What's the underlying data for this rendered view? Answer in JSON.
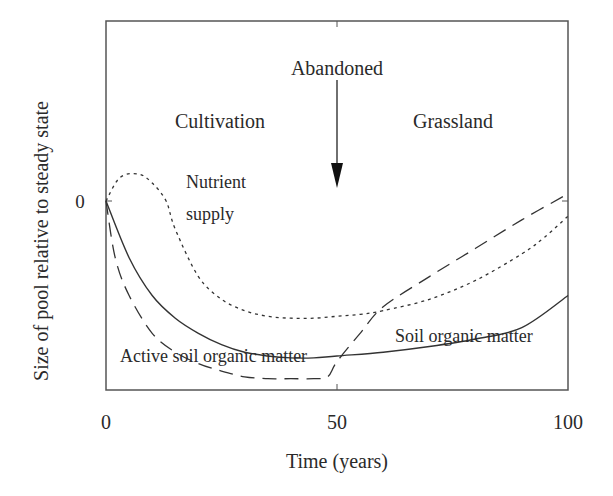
{
  "chart_data": {
    "type": "line",
    "title": "",
    "xlabel": "Time (years)",
    "ylabel": "Size of pool relative to steady state",
    "xlim": [
      0,
      100
    ],
    "ylim": [
      -1.0,
      0.95
    ],
    "x_ticks": [
      0,
      50,
      100
    ],
    "x_tick_labels": [
      "0",
      "50",
      "100"
    ],
    "y_ticks": [
      0
    ],
    "y_tick_labels": [
      "0"
    ],
    "grid": false,
    "legend": "none (curves labeled inline)",
    "annotations": [
      {
        "text": "Abandoned",
        "x": 50,
        "y": 0.8,
        "arrow": {
          "from_y": 0.64,
          "to_y": 0.07,
          "x": 50
        }
      },
      {
        "text": "Cultivation",
        "x": 25,
        "y": 0.48
      },
      {
        "text": "Grassland",
        "x": 75,
        "y": 0.48
      },
      {
        "text": "Nutrient",
        "x": 25,
        "y": 0.09
      },
      {
        "text": "supply",
        "x": 25,
        "y": -0.06
      },
      {
        "text": "Soil organic matter",
        "x": 81,
        "y": -0.75
      },
      {
        "text": "Active soil organic matter",
        "x": 28,
        "y": -0.86
      }
    ],
    "series": [
      {
        "name": "Nutrient supply",
        "style": "dotted",
        "x": [
          0,
          3,
          7,
          10,
          13,
          15,
          20,
          25,
          30,
          35,
          40,
          45,
          50,
          55,
          60,
          70,
          80,
          90,
          95,
          100
        ],
        "y": [
          0.0,
          0.13,
          0.15,
          0.1,
          0.0,
          -0.15,
          -0.4,
          -0.52,
          -0.58,
          -0.61,
          -0.62,
          -0.62,
          -0.61,
          -0.6,
          -0.58,
          -0.52,
          -0.42,
          -0.28,
          -0.19,
          -0.08
        ]
      },
      {
        "name": "Soil organic matter",
        "style": "solid",
        "x": [
          0,
          5,
          10,
          15,
          20,
          25,
          30,
          35,
          40,
          45,
          50,
          60,
          70,
          80,
          90,
          100
        ],
        "y": [
          0.0,
          -0.3,
          -0.5,
          -0.62,
          -0.7,
          -0.76,
          -0.8,
          -0.82,
          -0.83,
          -0.83,
          -0.82,
          -0.8,
          -0.77,
          -0.73,
          -0.67,
          -0.5
        ]
      },
      {
        "name": "Active soil organic matter",
        "style": "dashed",
        "x": [
          0,
          2,
          5,
          10,
          15,
          20,
          25,
          30,
          35,
          40,
          45,
          48,
          50,
          55,
          60,
          70,
          80,
          90,
          100
        ],
        "y": [
          0.0,
          -0.3,
          -0.5,
          -0.7,
          -0.8,
          -0.86,
          -0.9,
          -0.93,
          -0.94,
          -0.94,
          -0.94,
          -0.93,
          -0.85,
          -0.7,
          -0.56,
          -0.4,
          -0.25,
          -0.1,
          0.04
        ]
      }
    ]
  }
}
